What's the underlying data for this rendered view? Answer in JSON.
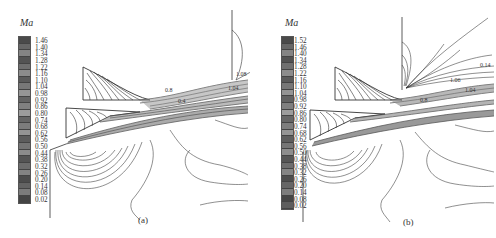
{
  "figure": {
    "panels": [
      {
        "id": "a",
        "caption": "(a)",
        "legend": {
          "title": "Ma",
          "levels": [
            "1.46",
            "1.40",
            "1.34",
            "1.28",
            "1.22",
            "1.16",
            "1.10",
            "1.04",
            "0.98",
            "0.92",
            "0.86",
            "0.80",
            "0.74",
            "0.68",
            "0.62",
            "0.56",
            "0.50",
            "0.44",
            "0.38",
            "0.32",
            "0.26",
            "0.20",
            "0.14",
            "0.08",
            "0.02"
          ]
        },
        "annotations": [
          "1.08",
          "0.5",
          "1.04",
          "0.4",
          "0.8"
        ]
      },
      {
        "id": "b",
        "caption": "(b)",
        "legend": {
          "title": "Ma",
          "levels": [
            "1.52",
            "1.46",
            "1.40",
            "1.34",
            "1.28",
            "1.22",
            "1.16",
            "1.10",
            "1.04",
            "0.98",
            "0.92",
            "0.86",
            "0.80",
            "0.74",
            "0.68",
            "0.62",
            "0.56",
            "0.50",
            "0.44",
            "0.38",
            "0.32",
            "0.26",
            "0.20",
            "0.14",
            "0.08",
            "0.02"
          ]
        },
        "annotations": [
          "0.14",
          "1.06",
          "1.04",
          "0.8"
        ]
      }
    ],
    "colors": {
      "legend_dark": "#3a3a3a",
      "legend_light": "#bdbdbd",
      "contour": "#333333",
      "background": "#ffffff"
    }
  }
}
